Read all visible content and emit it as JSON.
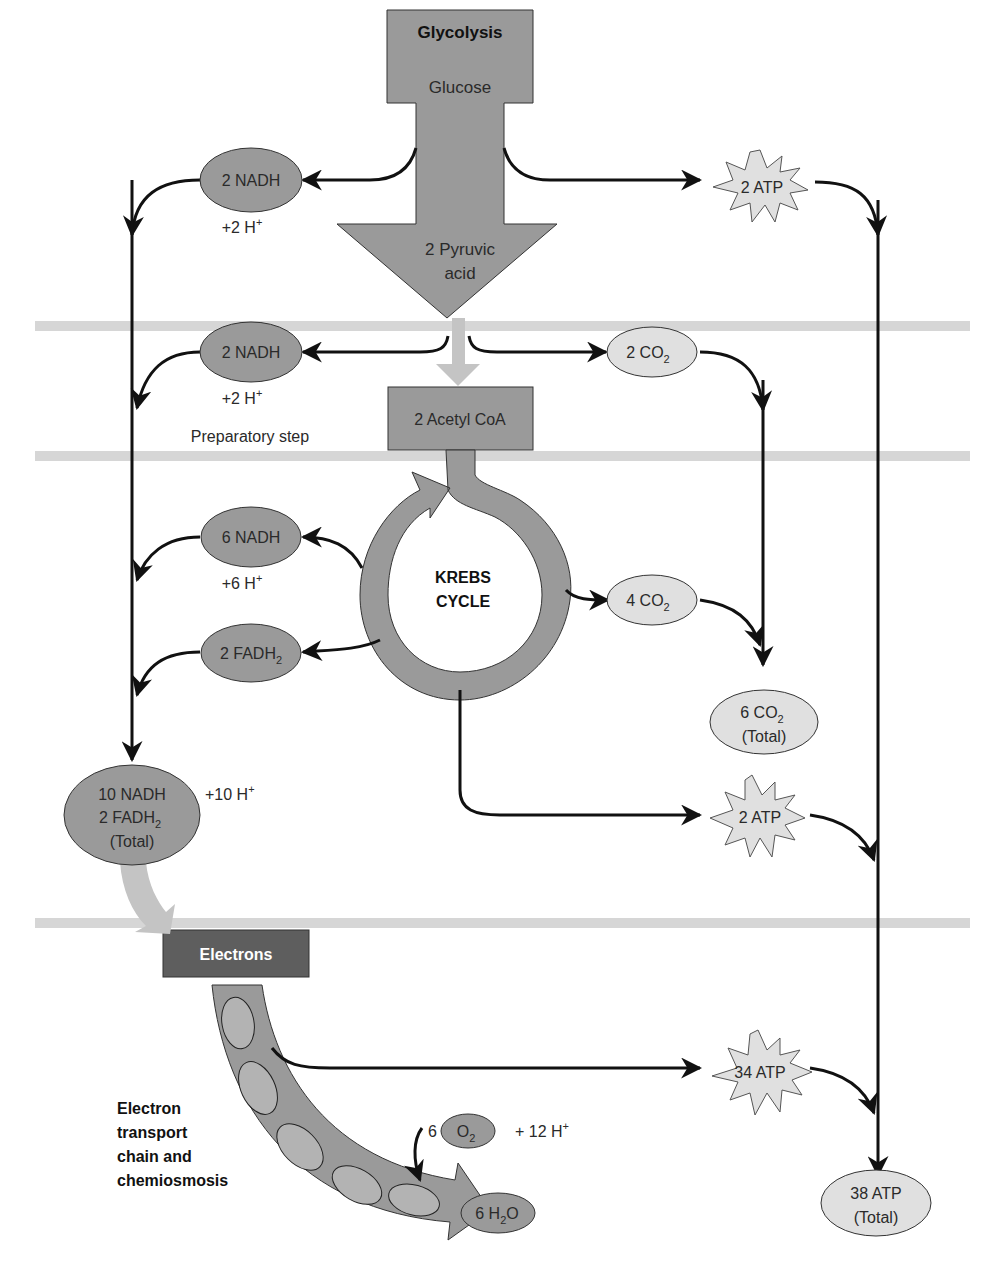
{
  "colors": {
    "dark_gray": "#9a9a9a",
    "light_gray": "#e0e0e0",
    "band": "#d6d6d6",
    "electrons_box": "#5e5e5e",
    "pale_arrow": "#c4c4c4",
    "line": "#111111"
  },
  "glycolysis": {
    "title": "Glycolysis",
    "input": "Glucose",
    "output_line1": "2 Pyruvic",
    "output_line2": "acid",
    "nadh": "2 NADH",
    "h_plus": "+2 H",
    "h_sup": "+",
    "atp": "2 ATP"
  },
  "preparatory": {
    "nadh": "2 NADH",
    "h_plus": "+2 H",
    "h_sup": "+",
    "co2": "2 CO",
    "co2_sub": "2",
    "product": "2 Acetyl CoA",
    "label": "Preparatory step"
  },
  "krebs": {
    "line1": "KREBS",
    "line2": "CYCLE",
    "nadh": "6 NADH",
    "h_plus": "+6 H",
    "h_sup": "+",
    "fadh": "2 FADH",
    "fadh_sub": "2",
    "co2": "4 CO",
    "co2_sub": "2",
    "atp": "2 ATP"
  },
  "totals": {
    "carriers_line1": "10 NADH",
    "carriers_line2": "2 FADH",
    "carriers_line2_sub": "2",
    "carriers_line3": "(Total)",
    "h_plus": "+10 H",
    "h_sup": "+",
    "co2_line1": "6 CO",
    "co2_sub": "2",
    "co2_line2": "(Total)",
    "atp_line1": "38 ATP",
    "atp_line2": "(Total)"
  },
  "etc": {
    "electrons": "Electrons",
    "label_line1": "Electron",
    "label_line2": "transport",
    "label_line3": "chain and",
    "label_line4": "chemiosmosis",
    "atp": "34 ATP",
    "o2_coef": "6",
    "o2": "O",
    "o2_sub": "2",
    "h_plus": "+ 12 H",
    "h_sup": "+",
    "water_pre": "6 H",
    "water_sub": "2",
    "water_post": "O"
  }
}
